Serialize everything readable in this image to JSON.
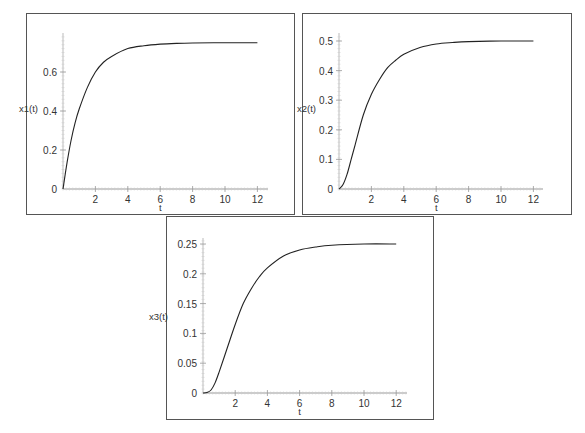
{
  "chart_data": [
    {
      "type": "line",
      "title": "",
      "xlabel": "t",
      "ylabel": "x1(t)",
      "xlim": [
        0,
        12
      ],
      "ylim": [
        0,
        0.77
      ],
      "xticks": [
        2,
        4,
        6,
        8,
        10,
        12
      ],
      "yticks": [
        0,
        0.2,
        0.4,
        0.6
      ],
      "ytick_labels": [
        "0",
        "0.2",
        "0.4",
        "0.6"
      ],
      "grid": false,
      "series": [
        {
          "name": "x1(t)",
          "x": [
            0,
            0.25,
            0.5,
            0.75,
            1,
            1.5,
            2,
            2.5,
            3,
            4,
            5,
            6,
            7,
            8,
            10,
            12
          ],
          "values": [
            0,
            0.135,
            0.25,
            0.34,
            0.41,
            0.52,
            0.6,
            0.65,
            0.68,
            0.72,
            0.735,
            0.743,
            0.747,
            0.749,
            0.75,
            0.75
          ]
        }
      ]
    },
    {
      "type": "line",
      "title": "",
      "xlabel": "t",
      "ylabel": "x2(t)",
      "xlim": [
        0,
        12
      ],
      "ylim": [
        0,
        0.53
      ],
      "xticks": [
        2,
        4,
        6,
        8,
        10,
        12
      ],
      "yticks": [
        0,
        0.1,
        0.2,
        0.3,
        0.4,
        0.5
      ],
      "ytick_labels": [
        "0",
        "0.1",
        "0.2",
        "0.3",
        "0.4",
        "0.5"
      ],
      "grid": false,
      "series": [
        {
          "name": "x2(t)",
          "x": [
            0,
            0.25,
            0.5,
            0.75,
            1,
            1.5,
            2,
            2.5,
            3,
            3.5,
            4,
            5,
            6,
            7,
            8,
            10,
            12
          ],
          "values": [
            0,
            0.015,
            0.05,
            0.1,
            0.15,
            0.25,
            0.32,
            0.37,
            0.41,
            0.435,
            0.455,
            0.478,
            0.49,
            0.495,
            0.498,
            0.5,
            0.5
          ]
        }
      ]
    },
    {
      "type": "line",
      "title": "",
      "xlabel": "t",
      "ylabel": "x3(t)",
      "xlim": [
        0,
        12
      ],
      "ylim": [
        0,
        0.26
      ],
      "xticks": [
        2,
        4,
        6,
        8,
        10,
        12
      ],
      "yticks": [
        0,
        0.05,
        0.1,
        0.15,
        0.2,
        0.25
      ],
      "ytick_labels": [
        "0",
        "0.05",
        "0.1",
        "0.15",
        "0.2",
        "0.25"
      ],
      "grid": false,
      "series": [
        {
          "name": "x3(t)",
          "x": [
            0,
            0.25,
            0.5,
            0.75,
            1,
            1.5,
            2,
            2.5,
            3,
            3.5,
            4,
            5,
            6,
            7,
            8,
            10,
            12
          ],
          "values": [
            0,
            0.001,
            0.005,
            0.017,
            0.035,
            0.075,
            0.115,
            0.15,
            0.175,
            0.195,
            0.21,
            0.23,
            0.24,
            0.245,
            0.248,
            0.25,
            0.25
          ]
        }
      ]
    }
  ]
}
